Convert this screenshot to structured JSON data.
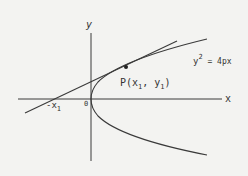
{
  "diagram": {
    "axis_labels": {
      "x": "x",
      "y": "y",
      "origin": "0"
    },
    "point_label": "P(x",
    "point_sub1": "1",
    "point_mid": ", y",
    "point_sub2": "1",
    "point_close": ")",
    "intercept_label": "-x",
    "intercept_sub": "1",
    "equation_base": "y",
    "equation_exp": "2",
    "equation_rest": " = 4px",
    "colors": {
      "line": "#3a3a3a",
      "background": "#f3f3f1"
    }
  }
}
